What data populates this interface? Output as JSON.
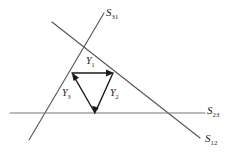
{
  "figure": {
    "background_color": "#ffffff",
    "line_color": "#555555",
    "vector_color": "#1a1a1a",
    "width": 237,
    "height": 159
  },
  "lines": [
    {
      "id": "s31",
      "base": "S",
      "subscript": "31",
      "x1": 29,
      "y1": 140,
      "x2": 104,
      "y2": 13,
      "label_x": 106,
      "label_y": 7
    },
    {
      "id": "s12",
      "base": "S",
      "subscript": "12",
      "x1": 52,
      "y1": 22,
      "x2": 200,
      "y2": 138,
      "label_x": 205,
      "label_y": 133
    },
    {
      "id": "s23",
      "base": "S",
      "subscript": "23",
      "x1": 10,
      "y1": 113,
      "x2": 205,
      "y2": 113,
      "label_x": 207,
      "label_y": 105
    }
  ],
  "vectors": [
    {
      "id": "y1",
      "base": "Y",
      "subscript": "1",
      "x1": 72,
      "y1": 73,
      "x2": 113,
      "y2": 73,
      "label_x": 86,
      "label_y": 56,
      "direction": "right"
    },
    {
      "id": "y2",
      "base": "Y",
      "subscript": "2",
      "x1": 113,
      "y1": 73,
      "x2": 95,
      "y2": 113,
      "label_x": 110,
      "label_y": 88,
      "direction": "down-left"
    },
    {
      "id": "y3",
      "base": "Y",
      "subscript": "3",
      "x1": 95,
      "y1": 113,
      "x2": 72,
      "y2": 73,
      "label_x": 62,
      "label_y": 88,
      "direction": "up-left"
    }
  ]
}
